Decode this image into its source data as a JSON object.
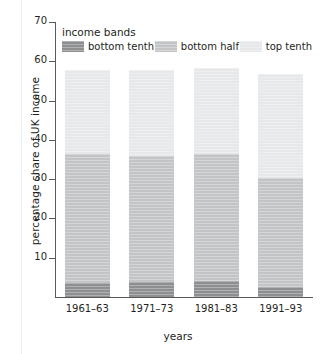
{
  "chart_data": {
    "type": "bar",
    "stacked": true,
    "title": "",
    "xlabel": "years",
    "ylabel": "percentage share of UK income",
    "categories": [
      "1961–63",
      "1971–73",
      "1981–83",
      "1991–93"
    ],
    "series": [
      {
        "name": "bottom tenth",
        "color": "#8e8f91",
        "values": [
          3.5,
          3.7,
          4.0,
          2.5
        ]
      },
      {
        "name": "bottom half",
        "color": "#c3c4c6",
        "values": [
          32.8,
          32.3,
          32.3,
          27.7
        ]
      },
      {
        "name": "top tenth",
        "color": "#e7e8ea",
        "values": [
          21.6,
          21.8,
          22.0,
          26.6
        ]
      }
    ],
    "cumulative_tops": [
      {
        "category": "1961–63",
        "bottom_tenth_top": 3.5,
        "bottom_half_top": 36.3,
        "total": 57.9
      },
      {
        "category": "1971–73",
        "bottom_tenth_top": 3.7,
        "bottom_half_top": 36.0,
        "total": 57.8
      },
      {
        "category": "1981–83",
        "bottom_tenth_top": 4.0,
        "bottom_half_top": 36.3,
        "total": 58.3
      },
      {
        "category": "1991–93",
        "bottom_tenth_top": 2.5,
        "bottom_half_top": 30.2,
        "total": 56.8
      }
    ],
    "ylim": [
      0,
      70
    ],
    "yticks": [
      10,
      20,
      30,
      40,
      50,
      60,
      70
    ],
    "ytick_labels": [
      "10",
      "20",
      "30",
      "40",
      "50",
      "60",
      "70"
    ],
    "grid": false,
    "legend_position": "inside-top-left"
  },
  "legend": {
    "title": "income bands",
    "entries": [
      {
        "label": "bottom tenth",
        "color": "#8e8f91"
      },
      {
        "label": "bottom half",
        "color": "#c3c4c6"
      },
      {
        "label": "top tenth",
        "color": "#e7e8ea"
      }
    ]
  },
  "axes": {
    "y_title": "percentage share of UK income",
    "x_title": "years"
  }
}
